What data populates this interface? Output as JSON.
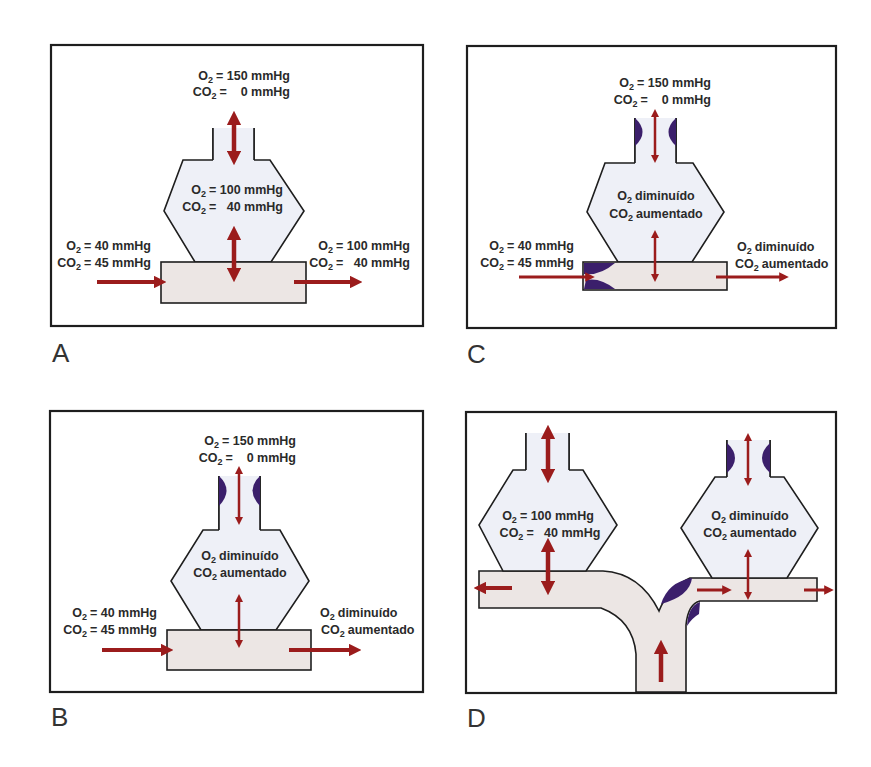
{
  "figure": {
    "colors": {
      "border": "#1e1e1e",
      "alveolus_fill": "#eef0f7",
      "capillary_fill": "#ece6e4",
      "arrow": "#9b1c1c",
      "obstruction": "#3b1f6b"
    },
    "panels": [
      {
        "id": "A",
        "label": "A",
        "state": "normal",
        "airway_obstruction": false,
        "capillary_obstruction": false,
        "inspired": {
          "o2": "O2 = 150 mmHg",
          "co2": "CO2 =    0 mmHg",
          "o2_prefix": "O",
          "o2_value": "= 150 mmHg",
          "co2_prefix": "CO",
          "co2_value": "=    0 mmHg"
        },
        "alveolus": {
          "o2_prefix": "O",
          "o2_value": "= 100 mmHg",
          "co2_prefix": "CO",
          "co2_value": "=   40 mmHg"
        },
        "venous": {
          "o2_prefix": "O",
          "o2_value": "= 40 mmHg",
          "co2_prefix": "CO",
          "co2_value": "= 45 mmHg"
        },
        "arterial": {
          "o2_prefix": "O",
          "o2_value": "= 100 mmHg",
          "co2_prefix": "CO",
          "co2_value": "=   40 mmHg"
        }
      },
      {
        "id": "B",
        "label": "B",
        "state": "airway obstruction (shunt)",
        "airway_obstruction": true,
        "capillary_obstruction": false,
        "inspired": {
          "o2_prefix": "O",
          "o2_value": "= 150 mmHg",
          "co2_prefix": "CO",
          "co2_value": "=    0 mmHg"
        },
        "alveolus": {
          "o2_prefix": "O",
          "o2_value": "diminuído",
          "co2_prefix": "CO",
          "co2_value": "aumentado"
        },
        "venous": {
          "o2_prefix": "O",
          "o2_value": "= 40 mmHg",
          "co2_prefix": "CO",
          "co2_value": "= 45 mmHg"
        },
        "arterial": {
          "o2_prefix": "O",
          "o2_value": "diminuído",
          "co2_prefix": "CO",
          "co2_value": "aumentado"
        }
      },
      {
        "id": "C",
        "label": "C",
        "state": "airway and capillary obstruction",
        "airway_obstruction": true,
        "capillary_obstruction": true,
        "inspired": {
          "o2_prefix": "O",
          "o2_value": "= 150 mmHg",
          "co2_prefix": "CO",
          "co2_value": "=    0 mmHg"
        },
        "alveolus": {
          "o2_prefix": "O",
          "o2_value": "diminuído",
          "co2_prefix": "CO",
          "co2_value": "aumentado"
        },
        "venous": {
          "o2_prefix": "O",
          "o2_value": "= 40 mmHg",
          "co2_prefix": "CO",
          "co2_value": "= 45 mmHg"
        },
        "arterial": {
          "o2_prefix": "O",
          "o2_value": "diminuído",
          "co2_prefix": "CO",
          "co2_value": "aumentado"
        }
      },
      {
        "id": "D",
        "label": "D",
        "state": "redistribution of blood flow",
        "left_alveolus": {
          "o2_prefix": "O",
          "o2_value": "= 100 mmHg",
          "co2_prefix": "CO",
          "co2_value": "=   40 mmHg",
          "airway_obstruction": false
        },
        "right_alveolus": {
          "o2_prefix": "O",
          "o2_value": "diminuído",
          "co2_prefix": "CO",
          "co2_value": "aumentado",
          "airway_obstruction": true
        },
        "capillary_branch_obstruction": true
      }
    ],
    "subscript": "2"
  }
}
